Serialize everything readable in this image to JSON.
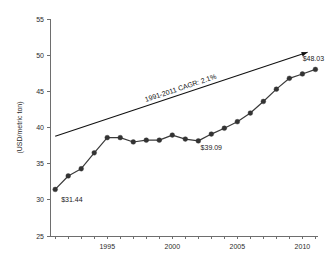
{
  "chart_data": {
    "type": "line",
    "title": "",
    "xlabel": "",
    "ylabel": "(USD/metric ton)",
    "xlim": [
      1990.6,
      2011.2
    ],
    "ylim": [
      25,
      55
    ],
    "grid": false,
    "legend": "none",
    "y_ticks": [
      25,
      30,
      35,
      40,
      45,
      50,
      55
    ],
    "y_tick_labels": [
      "25",
      "30",
      "35",
      "40",
      "45",
      "50",
      "55"
    ],
    "x_ticks": [
      1991,
      1992,
      1993,
      1994,
      1995,
      1996,
      1997,
      1998,
      1999,
      2000,
      2001,
      2002,
      2003,
      2004,
      2005,
      2006,
      2007,
      2008,
      2009,
      2010,
      2011
    ],
    "x_tick_labels_shown": [
      "1995",
      "2000",
      "2005",
      "2010"
    ],
    "x_tick_labels_shown_values": [
      1995,
      2000,
      2005,
      2010
    ],
    "x": [
      1991,
      1992,
      1993,
      1994,
      1995,
      1996,
      1997,
      1998,
      1999,
      2000,
      2001,
      2002,
      2003,
      2004,
      2005,
      2006,
      2007,
      2008,
      2009,
      2010,
      2011
    ],
    "values": [
      31.44,
      33.3,
      34.3,
      36.5,
      38.6,
      38.6,
      38.0,
      38.25,
      38.25,
      38.95,
      38.4,
      38.15,
      39.09,
      39.9,
      40.8,
      42.0,
      43.6,
      45.3,
      46.8,
      47.4,
      48.03
    ],
    "series": [
      {
        "name": "price",
        "values": [
          31.44,
          33.3,
          34.3,
          36.5,
          38.6,
          38.6,
          38.0,
          38.25,
          38.25,
          38.95,
          38.4,
          38.15,
          39.09,
          39.9,
          40.8,
          42.0,
          43.6,
          45.3,
          46.8,
          47.4,
          48.03
        ]
      }
    ],
    "annotations": [
      {
        "id": "start-value",
        "label": "$31.44",
        "x": 1991,
        "y": 31.44
      },
      {
        "id": "mid-value",
        "label": "$39.09",
        "x": 2003,
        "y": 39.09
      },
      {
        "id": "end-value",
        "label": "$48.03",
        "x": 2011,
        "y": 48.03
      }
    ],
    "trend": {
      "label": "1991-2011 CAGR: 2.1%",
      "x_start": 1991,
      "y_start": 38.8,
      "x_end": 2010.4,
      "y_end": 50.4,
      "style": "arrow"
    },
    "colors": {
      "series": "#333333",
      "trend": "#111111",
      "axis": "#6e6e6e",
      "text": "#1a1a1a",
      "background": "#ffffff"
    }
  }
}
